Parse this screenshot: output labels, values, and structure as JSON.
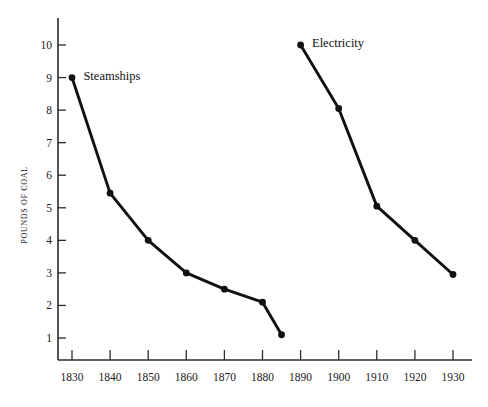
{
  "chart_data": {
    "type": "line",
    "title": "",
    "subtitle": "",
    "xlabel": "",
    "ylabel": "POUNDS OF COAL",
    "xlim": [
      1825,
      1932
    ],
    "ylim": [
      0,
      10.6
    ],
    "x_ticks": [
      1830,
      1840,
      1850,
      1860,
      1870,
      1880,
      1890,
      1900,
      1910,
      1920,
      1930
    ],
    "y_ticks": [
      1,
      2,
      3,
      4,
      5,
      6,
      7,
      8,
      9,
      10
    ],
    "grid": false,
    "legend_position": "inline-annotation",
    "series": [
      {
        "name": "Steamships",
        "label_x": 1833,
        "label_y": 9.05,
        "x": [
          1830,
          1840,
          1850,
          1860,
          1870,
          1880,
          1885
        ],
        "values": [
          9.0,
          5.45,
          4.0,
          3.0,
          2.5,
          2.1,
          1.1
        ]
      },
      {
        "name": "Electricity",
        "label_x": 1893,
        "label_y": 10.05,
        "x": [
          1890,
          1900,
          1910,
          1920,
          1930
        ],
        "values": [
          10.0,
          8.05,
          5.05,
          4.0,
          2.95
        ]
      }
    ],
    "annotations": [
      {
        "text": "Steamships",
        "x": 1833,
        "y": 9.05
      },
      {
        "text": "Electricity",
        "x": 1893,
        "y": 10.05
      }
    ],
    "colors": {
      "line": "#111111",
      "marker": "#111111",
      "axis": "#2b2b2b",
      "text": "#1a1a1a",
      "background": "#ffffff"
    }
  },
  "axes": {
    "y_title": "POUNDS OF COAL",
    "y_tick_labels": [
      "10",
      "9",
      "8",
      "7",
      "6",
      "5",
      "4",
      "3",
      "2",
      "1"
    ],
    "x_tick_labels": [
      "1830",
      "1840",
      "1850",
      "1860",
      "1870",
      "1880",
      "1890",
      "1900",
      "1910",
      "1920",
      "1930"
    ]
  },
  "labels": {
    "steamships": "Steamships",
    "electricity": "Electricity"
  }
}
